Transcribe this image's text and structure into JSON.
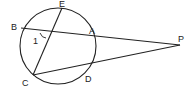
{
  "diagram": {
    "type": "circle-secants",
    "stroke_color": "#222222",
    "background": "#ffffff",
    "circle": {
      "cx": 58,
      "cy": 46,
      "r": 38
    },
    "points": {
      "E": {
        "label": "E",
        "x": 62,
        "y": 8
      },
      "B": {
        "label": "B",
        "x": 21,
        "y": 28
      },
      "A": {
        "label": "A",
        "x": 95,
        "y": 36
      },
      "C": {
        "label": "C",
        "x": 33,
        "y": 75
      },
      "D": {
        "label": "D",
        "x": 85,
        "y": 70
      },
      "P": {
        "label": "P",
        "x": 180,
        "y": 45
      }
    },
    "angle_label": "1",
    "segments": [
      [
        "E",
        "C"
      ],
      [
        "B",
        "P"
      ],
      [
        "C",
        "P"
      ]
    ]
  }
}
